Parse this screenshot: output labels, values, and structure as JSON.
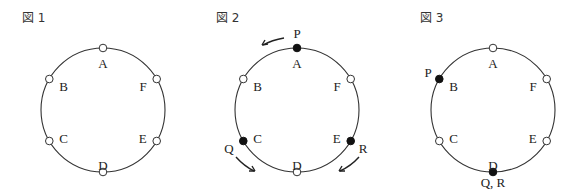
{
  "figures": [
    {
      "title": "図 1",
      "nodes": [
        {
          "id": "A",
          "filled": false
        },
        {
          "id": "B",
          "filled": false
        },
        {
          "id": "C",
          "filled": false
        },
        {
          "id": "D",
          "filled": false
        },
        {
          "id": "E",
          "filled": false
        },
        {
          "id": "F",
          "filled": false
        }
      ],
      "markers": [],
      "arrows": []
    },
    {
      "title": "図 2",
      "nodes": [
        {
          "id": "A",
          "filled": true
        },
        {
          "id": "B",
          "filled": false
        },
        {
          "id": "C",
          "filled": true
        },
        {
          "id": "D",
          "filled": false
        },
        {
          "id": "E",
          "filled": true
        },
        {
          "id": "F",
          "filled": false
        }
      ],
      "markers": [
        {
          "label": "P",
          "at": "A"
        },
        {
          "label": "Q",
          "at": "C"
        },
        {
          "label": "R",
          "at": "E"
        }
      ],
      "arrows": [
        {
          "mover": "P",
          "direction": "counterclockwise"
        },
        {
          "mover": "Q",
          "direction": "counterclockwise"
        },
        {
          "mover": "R",
          "direction": "clockwise"
        }
      ]
    },
    {
      "title": "図 3",
      "nodes": [
        {
          "id": "A",
          "filled": false
        },
        {
          "id": "B",
          "filled": true
        },
        {
          "id": "C",
          "filled": false
        },
        {
          "id": "D",
          "filled": true
        },
        {
          "id": "E",
          "filled": false
        },
        {
          "id": "F",
          "filled": false
        }
      ],
      "markers": [
        {
          "label": "P",
          "at": "B"
        },
        {
          "label": "Q, R",
          "at": "D"
        }
      ],
      "arrows": []
    }
  ]
}
